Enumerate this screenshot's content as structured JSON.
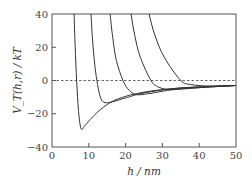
{
  "chart_data": {
    "type": "line",
    "title": "",
    "xlabel": "h / nm",
    "ylabel": "V_T(h,r) / kT",
    "xlim": [
      0,
      50
    ],
    "ylim": [
      -40,
      40
    ],
    "xticks": [
      0,
      10,
      20,
      30,
      40,
      50
    ],
    "yticks": [
      -40,
      -20,
      0,
      20,
      40
    ],
    "grid": false,
    "legend": null,
    "reference_line": {
      "y": 0,
      "style": "dashed"
    },
    "series": [
      {
        "name": "curve-1",
        "x": [
          6.0,
          6.3,
          6.7,
          7.2,
          7.9,
          9,
          11,
          14,
          18,
          25,
          35,
          50
        ],
        "y": [
          40,
          20,
          0,
          -18,
          -29,
          -27,
          -22,
          -16,
          -11,
          -7,
          -4.5,
          -3
        ]
      },
      {
        "name": "curve-2",
        "x": [
          10.6,
          11.0,
          11.6,
          12.2,
          13,
          14,
          16,
          20,
          25,
          35,
          50
        ],
        "y": [
          40,
          25,
          10,
          0,
          -9,
          -13,
          -13,
          -10.5,
          -7.5,
          -4.5,
          -3
        ]
      },
      {
        "name": "curve-3",
        "x": [
          15.8,
          16.5,
          17.5,
          19.3,
          21,
          23,
          26,
          30,
          35,
          50
        ],
        "y": [
          40,
          26,
          12,
          0,
          -6,
          -8.5,
          -8,
          -6.5,
          -5,
          -3
        ]
      },
      {
        "name": "curve-4",
        "x": [
          21.5,
          22.5,
          24,
          26.9,
          29,
          32,
          36,
          42,
          50
        ],
        "y": [
          40,
          27,
          14,
          0,
          -4,
          -5.5,
          -5,
          -4,
          -3
        ]
      },
      {
        "name": "curve-5",
        "x": [
          26.4,
          28,
          30.5,
          35,
          38,
          42,
          46,
          50
        ],
        "y": [
          40,
          27,
          14,
          0,
          -2.5,
          -3.3,
          -3.2,
          -3
        ]
      }
    ]
  },
  "labels": {
    "xlabel": "h / nm",
    "ylabel": "V_T(h,r) / kT",
    "xtick_labels": [
      "0",
      "10",
      "20",
      "30",
      "40",
      "50"
    ],
    "ytick_labels": [
      "−40",
      "−20",
      "0",
      "20",
      "40"
    ]
  }
}
